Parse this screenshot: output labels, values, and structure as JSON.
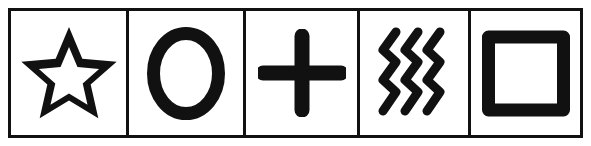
{
  "figure": {
    "kind": "symbol-row",
    "background_color": "#ffffff",
    "ink_color": "#111111",
    "frame": {
      "border_color": "#111111",
      "border_width_px": 3,
      "cell_count": 5,
      "divider_color": "#111111",
      "divider_width_px": 3
    }
  },
  "cells": [
    {
      "index": 1,
      "icon": "star-icon",
      "label": "Star",
      "style": "outline",
      "fill": "hollow",
      "points": 5,
      "stroke_color": "#111111"
    },
    {
      "index": 2,
      "icon": "circle-icon",
      "label": "Circle",
      "style": "outline",
      "fill": "hollow",
      "points": 0,
      "stroke_color": "#111111"
    },
    {
      "index": 3,
      "icon": "plus-icon",
      "label": "Cross",
      "style": "solid",
      "fill": "solid",
      "points": 0,
      "stroke_color": "#111111"
    },
    {
      "index": 4,
      "icon": "waves-icon",
      "label": "Waves",
      "style": "stroke",
      "fill": "solid",
      "points": 3,
      "stroke_color": "#111111"
    },
    {
      "index": 5,
      "icon": "square-icon",
      "label": "Square",
      "style": "outline",
      "fill": "hollow",
      "points": 4,
      "stroke_color": "#111111"
    }
  ]
}
